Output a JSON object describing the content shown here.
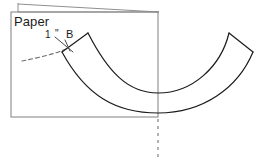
{
  "figure": {
    "type": "technical-line-diagram",
    "background_color": "#ffffff",
    "stroke_color": "#1b1b1b",
    "frame_color": "#777777",
    "dash_color": "#8a8a8a"
  },
  "labels": {
    "paper": "Paper",
    "dimension_value": "1",
    "dimension_unit": "\"",
    "point_b": "B"
  },
  "annotations": {
    "dimension_text": "1 \"",
    "dimension_meaning": "one inch",
    "point_label": "B"
  },
  "geometry": {
    "paper_sheet": {
      "name": "paper-rectangle",
      "x": 11,
      "y": 12,
      "width": 147,
      "height": 105
    },
    "sheet_back_edge": {
      "name": "paper-back-edge",
      "points": "18,3 18,12 159,12"
    },
    "outer_curve": {
      "name": "band-outer-curve",
      "path": "M 62,52 L 88,33 C 112,70 135,93 158,100 C 185,108 212,88 229,33"
    },
    "inner_curve": {
      "name": "band-inner-curve",
      "path": "M 88,33 C 110,78 130,93 158,93 C 192,93 222,64 229,33"
    },
    "band_right_cap": {
      "name": "band-right-cap",
      "path": "M 229,33 L 253,52"
    },
    "band_right_inner": {
      "name": "band-right-inner-curve",
      "path": "M 253,52 C 235,112 190,122 158,113 C 128,105 100,72 88,33"
    },
    "leader_dashed_curve": {
      "name": "tangent-dashed-curve",
      "path": "M 22,61 C 36,58 52,55 66,49"
    },
    "dimension_leader": {
      "name": "dimension-leader-line",
      "path": "M 56,37 L 72,51"
    },
    "dimension_tick": {
      "name": "dimension-tick",
      "path": "M 66,41 L 70,50"
    },
    "centerline_dashed": {
      "name": "vertical-centerline",
      "x": 158,
      "y1": 119,
      "y2": 158
    }
  },
  "canvas": {
    "width": 262,
    "height": 164
  }
}
